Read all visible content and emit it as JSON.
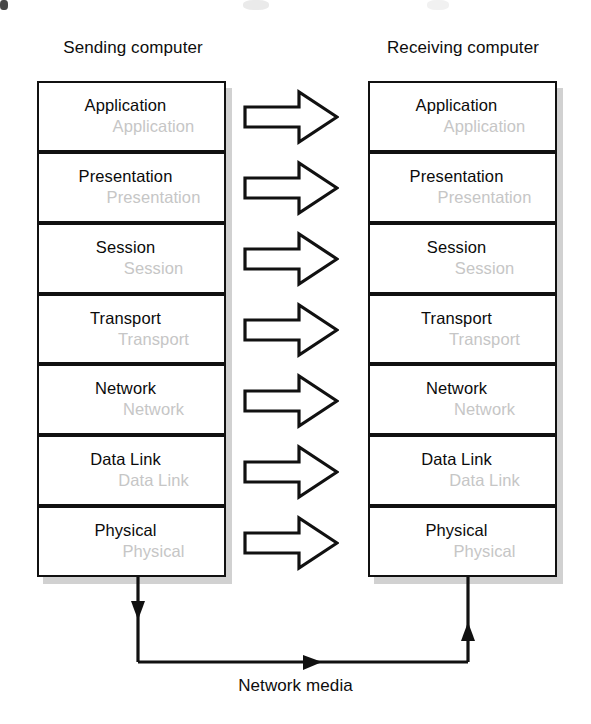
{
  "diagram": {
    "columns": {
      "sending": {
        "caption": "Sending computer"
      },
      "receiving": {
        "caption": "Receiving computer"
      }
    },
    "layers": [
      {
        "name": "Application",
        "ghost": "Application"
      },
      {
        "name": "Presentation",
        "ghost": "Presentation"
      },
      {
        "name": "Session",
        "ghost": "Session"
      },
      {
        "name": "Transport",
        "ghost": "Transport"
      },
      {
        "name": "Network",
        "ghost": "Network"
      },
      {
        "name": "Data Link",
        "ghost": "Data Link"
      },
      {
        "name": "Physical",
        "ghost": "Physical"
      }
    ],
    "media": {
      "label": "Network media"
    },
    "arrows": {
      "peer_arrow_count": 7,
      "peer_arrow_direction": "right",
      "media_flow": "down-right-up"
    },
    "colors": {
      "stroke": "#111111",
      "ghost_text": "#c6c6c6",
      "shadow": "#c9c9c9",
      "background": "#ffffff"
    }
  },
  "chart_data": {
    "type": "table",
    "categories": [
      "Application",
      "Presentation",
      "Session",
      "Transport",
      "Network",
      "Data Link",
      "Physical"
    ],
    "series": [
      {
        "name": "Sending computer",
        "values": [
          "Application",
          "Presentation",
          "Session",
          "Transport",
          "Network",
          "Data Link",
          "Physical"
        ]
      },
      {
        "name": "Receiving computer",
        "values": [
          "Application",
          "Presentation",
          "Session",
          "Transport",
          "Network",
          "Data Link",
          "Physical"
        ]
      }
    ],
    "annotations": [
      "Network media"
    ]
  }
}
